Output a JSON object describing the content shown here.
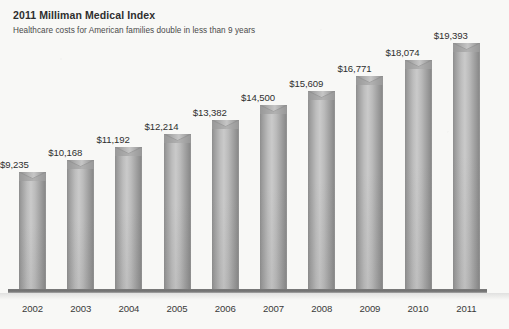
{
  "header": {
    "title": "2011 Milliman Medical Index",
    "subtitle": "Healthcare costs for American families double in less than 9 years"
  },
  "colors": {
    "background": "#f8f8f6",
    "bar_light": "#cacaca",
    "bar_mid": "#a8a8a8",
    "bar_dark": "#8a8a8a",
    "axis": "#6f6f6f",
    "title_text": "#2e2e2e",
    "label_text": "#2f2f2f"
  },
  "chart_data": {
    "type": "bar",
    "title": "2011 Milliman Medical Index",
    "subtitle": "Healthcare costs for American families double in less than 9 years",
    "xlabel": "",
    "ylabel": "",
    "ylim": [
      0,
      19393
    ],
    "grid": false,
    "legend": null,
    "categories": [
      "2002",
      "2003",
      "2004",
      "2005",
      "2006",
      "2007",
      "2008",
      "2009",
      "2010",
      "2011"
    ],
    "values": [
      9235,
      10168,
      11192,
      12214,
      13382,
      14500,
      15609,
      16771,
      18074,
      19393
    ],
    "value_labels": [
      "$9,235",
      "$10,168",
      "$11,192",
      "$12,214",
      "$13,382",
      "$14,500",
      "$15,609",
      "$16,771",
      "$18,074",
      "$19,393"
    ]
  }
}
